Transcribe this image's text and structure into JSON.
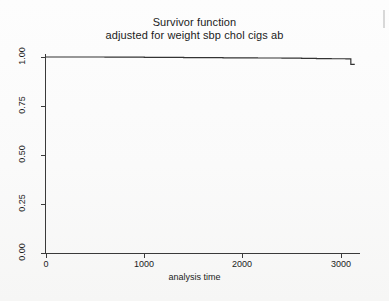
{
  "figure": {
    "title": "Survivor function",
    "subtitle": "adjusted for weight sbp chol cigs ab"
  },
  "chart_data": {
    "type": "line",
    "subtype": "step",
    "title": "Survivor function",
    "subtitle": "adjusted for weight sbp chol cigs ab",
    "xlabel": "analysis time",
    "ylabel": "",
    "xlim": [
      0,
      3150
    ],
    "ylim": [
      0,
      1.0
    ],
    "xticks": [
      0,
      1000,
      2000,
      3000
    ],
    "xtick_labels": [
      "0",
      "1000",
      "2000",
      "3000"
    ],
    "yticks": [
      0.0,
      0.25,
      0.5,
      0.75,
      1.0
    ],
    "ytick_labels": [
      "0.00",
      "0.25",
      "0.50",
      "0.75",
      "1.00"
    ],
    "grid": false,
    "legend": false,
    "line_color": "#333333",
    "series": [
      {
        "name": "Survivor function",
        "x": [
          0,
          250,
          600,
          1000,
          1400,
          1800,
          2150,
          2400,
          2600,
          2750,
          2900,
          3050,
          3100,
          3100,
          3140
        ],
        "y": [
          1.0,
          1.0,
          0.999,
          0.998,
          0.997,
          0.996,
          0.995,
          0.994,
          0.993,
          0.992,
          0.991,
          0.99,
          0.99,
          0.962,
          0.962
        ]
      }
    ],
    "annotations": []
  },
  "axes": {
    "y_tick_labels": [
      "1.00",
      "0.75",
      "0.50",
      "0.25",
      "0.00"
    ],
    "x_tick_labels": [
      "0",
      "1000",
      "2000",
      "3000"
    ],
    "x_axis_title": "analysis time"
  }
}
